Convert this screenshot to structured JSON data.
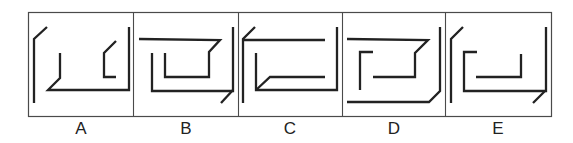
{
  "figure": {
    "type": "multiple-choice line-figure options",
    "panel_count": 5
  },
  "style": {
    "line_color": "#222222",
    "frame_color": "#4a4a4a",
    "label_color": "#222222",
    "background": "#ffffff"
  },
  "panels": [
    {
      "label": "A",
      "strokes": [
        "47,27 34,39 34,103",
        "60,53 60,78 48,90 129,90 129,27",
        "116,41 104,53 104,77 116,77"
      ]
    },
    {
      "label": "B",
      "strokes": [
        "139,39 220,40 209,52 209,77 165,77 165,53",
        "152,53 152,91 233,91 233,27",
        "233,90 221,103"
      ]
    },
    {
      "label": "C",
      "strokes": [
        "255,27 243,39 243,103",
        "243,40 325,40",
        "256,53 256,90 337,90 337,27",
        "256,90 270,77 325,77"
      ]
    },
    {
      "label": "D",
      "strokes": [
        "347,39 428,40 415,53 415,77 373,77",
        "373,52 360,52 360,90",
        "347,102 429,102 440,91 440,27"
      ]
    },
    {
      "label": "E",
      "strokes": [
        "463,27 451,39 451,103",
        "477,52 464,52 464,91 546,91 546,27",
        "545,91 533,103",
        "476,77 521,77 521,54"
      ]
    }
  ]
}
